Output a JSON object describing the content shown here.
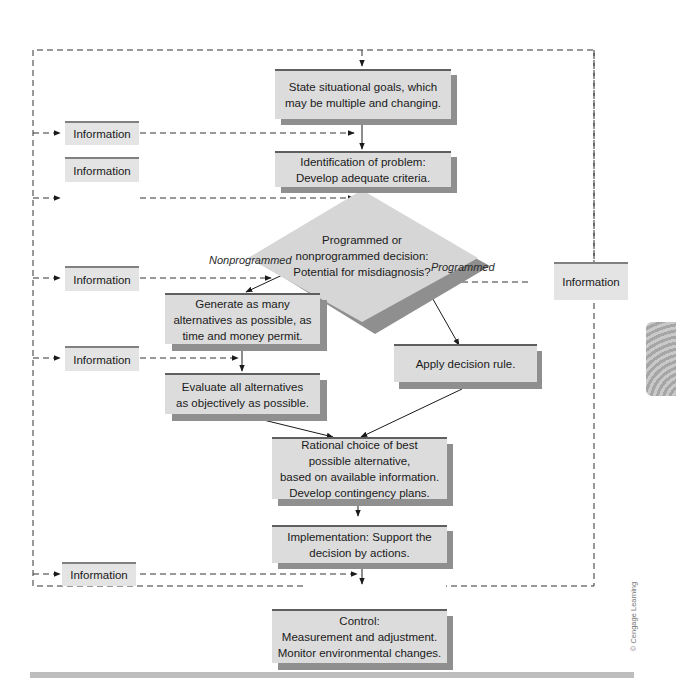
{
  "diagram": {
    "type": "flowchart",
    "steps": {
      "goals": "State situational goals, which\nmay be multiple and changing.",
      "identify": "Identification of problem:\nDevelop adequate criteria.",
      "decision": "Programmed or\nnonprogrammed decision:\nPotential for misdiagnosis?",
      "generate": "Generate as many\nalternatives as possible, as\ntime and money permit.",
      "evaluate": "Evaluate all alternatives\nas objectively as possible.",
      "apply_rule": "Apply decision rule.",
      "rational_choice": "Rational choice of best\npossible alternative,\nbased on available information.\nDevelop contingency plans.",
      "implementation": "Implementation: Support the\ndecision by actions.",
      "control": "Control:\nMeasurement and adjustment.\nMonitor environmental changes."
    },
    "branch_labels": {
      "nonprogrammed": "Nonprogrammed",
      "programmed": "Programmed"
    },
    "information_boxes": [
      {
        "id": "info-1",
        "label": "Information"
      },
      {
        "id": "info-2",
        "label": "Information"
      },
      {
        "id": "info-3",
        "label": "Information"
      },
      {
        "id": "info-4",
        "label": "Information"
      },
      {
        "id": "info-5",
        "label": "Information"
      },
      {
        "id": "info-right",
        "label": "Information"
      }
    ],
    "copyright": "© Cengage Learning",
    "colors": {
      "box_fill": "#dcdcdc",
      "box_top_border": "#5f5f5f",
      "box_shadow": "#8f8f8f",
      "info_fill": "#e4e4e4",
      "diamond_fill": "#d6d6d6",
      "line": "#1a1a1a"
    }
  }
}
